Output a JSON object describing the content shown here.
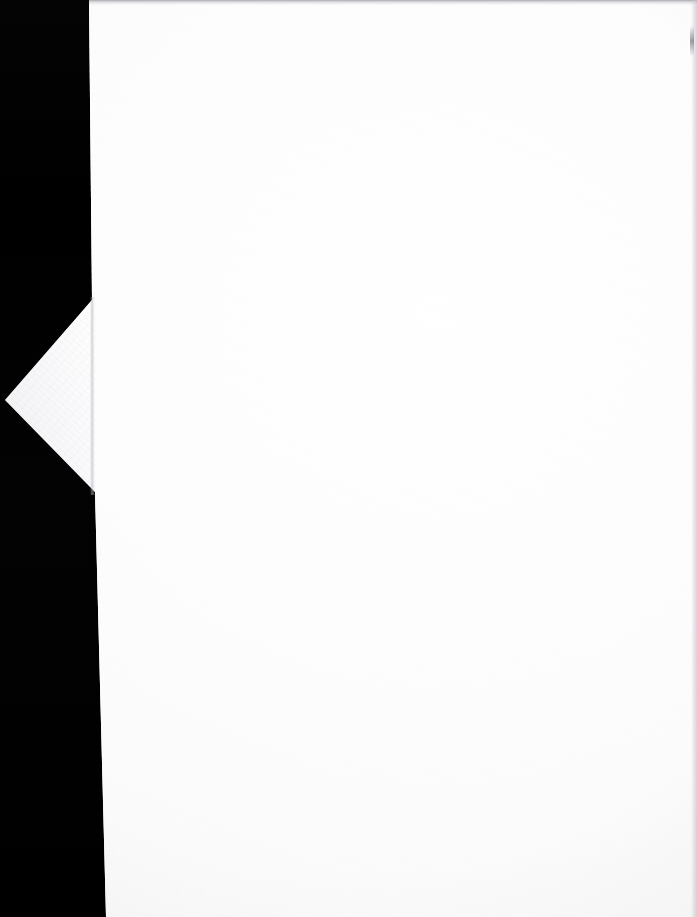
{
  "document": {
    "kind": "scanned-page",
    "title": "Scanned blank page",
    "page_content": "",
    "has_visible_text": false,
    "orientation": "portrait"
  },
  "canvas": {
    "width": 697,
    "height": 917
  },
  "scanner_bed": {
    "name": "black scanner backdrop",
    "color": "#000000",
    "band_width_px": 89,
    "position": "left"
  },
  "paper": {
    "name": "paper sheet",
    "color": "#fcfcfd",
    "highlight_color": "#ffffff",
    "shadow_color": "#f7f7f9",
    "left_edge_top_px": 89,
    "left_edge_bottom_px": 106,
    "right_edge_px": 697,
    "texture": "fine paper grain"
  },
  "corner_flap": {
    "name": "folded corner flap",
    "color": "#fbfbfc",
    "shadow_color": "#e1e1e9",
    "apex_x": 5,
    "apex_y": 400,
    "top_vertex_x": 92,
    "top_vertex_y": 300,
    "bottom_vertex_x": 95,
    "bottom_vertex_y": 492
  },
  "fold_crease": {
    "name": "fold crease line",
    "color": "#b0b0ba",
    "x": 92,
    "y_start": 297,
    "y_end": 495
  },
  "top_edge": {
    "name": "underlying page edge strip",
    "color": "#787880",
    "height_px": 5
  },
  "right_seam": {
    "name": "right margin seam",
    "color": "#bababc",
    "x": 691
  }
}
